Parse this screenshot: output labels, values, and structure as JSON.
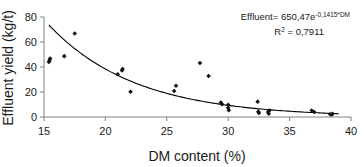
{
  "chart_data": {
    "type": "scatter",
    "title": "",
    "xlabel": "DM content (%)",
    "ylabel": "Effluent yield (kg/t)",
    "xlim": [
      15,
      40
    ],
    "ylim": [
      0,
      80
    ],
    "xticks": [
      15,
      20,
      25,
      30,
      35,
      40
    ],
    "yticks": [
      0,
      20,
      40,
      60,
      80
    ],
    "grid": false,
    "legend": null,
    "annotations": [
      "Effluent= 650,47e-0,1415*DM",
      "R2 = 0,7911"
    ],
    "equation": {
      "lhs": "Effluent=",
      "coefficient": "650,47",
      "base": "e",
      "exponent": "-0,1415*DM",
      "r_squared_label": "R",
      "r_squared_sup": "2",
      "r_squared_value": "= 0,7911"
    },
    "fit": {
      "kind": "exponential",
      "a": 650.47,
      "b": -0.1415,
      "r2": 0.7911,
      "x_start": 15.4,
      "x_end": 39.0
    },
    "series": [
      {
        "name": "Effluent yield observations",
        "marker": "diamond",
        "color": "#111111",
        "points": [
          [
            15.4,
            44.0
          ],
          [
            15.45,
            45.5
          ],
          [
            15.5,
            46.8
          ],
          [
            16.65,
            48.7
          ],
          [
            17.5,
            66.8
          ],
          [
            21.0,
            34.2
          ],
          [
            21.35,
            37.3
          ],
          [
            21.4,
            38.4
          ],
          [
            22.05,
            20.2
          ],
          [
            25.6,
            20.8
          ],
          [
            25.75,
            25.0
          ],
          [
            27.7,
            43.2
          ],
          [
            28.4,
            32.8
          ],
          [
            29.4,
            11.6
          ],
          [
            29.5,
            10.2
          ],
          [
            30.0,
            9.8
          ],
          [
            30.0,
            7.4
          ],
          [
            30.05,
            5.4
          ],
          [
            32.4,
            12.3
          ],
          [
            32.45,
            4.3
          ],
          [
            32.5,
            3.2
          ],
          [
            33.25,
            4.0
          ],
          [
            33.3,
            2.6
          ],
          [
            33.35,
            5.2
          ],
          [
            36.8,
            5.2
          ],
          [
            37.0,
            4.0
          ],
          [
            38.3,
            2.2
          ],
          [
            38.45,
            2.0
          ],
          [
            38.5,
            2.6
          ]
        ]
      }
    ]
  },
  "axes": {
    "x_tick_labels": [
      "15",
      "20",
      "25",
      "30",
      "35",
      "40"
    ],
    "y_tick_labels": [
      "0",
      "20",
      "40",
      "60",
      "80"
    ],
    "x_axis_title": "DM content (%)",
    "y_axis_title": "Effluent yield (kg/t)"
  }
}
